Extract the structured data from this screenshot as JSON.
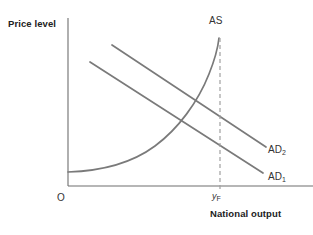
{
  "figure": {
    "type": "economics-diagram",
    "title_visible": false,
    "background_color": "#ffffff",
    "line_color": "#7a7a7a",
    "axis_color": "#6e6e6e",
    "dashed_color": "#a0a0a0"
  },
  "axes": {
    "y_axis_label": "Price level",
    "x_axis_label": "National output",
    "origin_label": "O",
    "x_marker_label": "y",
    "x_marker_subscript": "F"
  },
  "curves": [
    {
      "id": "as",
      "label": "AS",
      "label_subscript": "",
      "description": "Aggregate supply curve, flat at low output and near-vertical at full-employment output"
    },
    {
      "id": "ad2",
      "label": "AD",
      "label_subscript": "2",
      "description": "Higher aggregate demand curve, downward sloping"
    },
    {
      "id": "ad1",
      "label": "AD",
      "label_subscript": "1",
      "description": "Lower aggregate demand curve, downward sloping"
    }
  ],
  "chart_data": {
    "type": "line",
    "title": "",
    "xlabel": "National output",
    "ylabel": "Price level",
    "grid": false,
    "legend": "inline-labels",
    "xlim": [
      0,
      1
    ],
    "ylim": [
      0,
      1
    ],
    "annotations": [
      {
        "text": "AS",
        "x": 0.62,
        "y": 0.95
      },
      {
        "text": "AD2",
        "x": 0.96,
        "y": 0.27
      },
      {
        "text": "AD1",
        "x": 0.96,
        "y": 0.08
      },
      {
        "text": "O",
        "x": 0.0,
        "y": 0.0
      },
      {
        "text": "yF",
        "x": 0.74,
        "y": 0.0
      }
    ],
    "vertical_reference_line": {
      "label": "yF",
      "x": 0.74,
      "style": "dashed"
    },
    "series": [
      {
        "name": "AS",
        "style": "solid",
        "points": [
          [
            0.0,
            0.095
          ],
          [
            0.12,
            0.11
          ],
          [
            0.24,
            0.15
          ],
          [
            0.36,
            0.215
          ],
          [
            0.46,
            0.3
          ],
          [
            0.55,
            0.42
          ],
          [
            0.62,
            0.56
          ],
          [
            0.68,
            0.7
          ],
          [
            0.72,
            0.83
          ],
          [
            0.74,
            0.96
          ]
        ]
      },
      {
        "name": "AD2",
        "style": "solid",
        "points": [
          [
            0.22,
            0.88
          ],
          [
            1.0,
            0.31
          ]
        ]
      },
      {
        "name": "AD1",
        "style": "solid",
        "points": [
          [
            0.11,
            0.76
          ],
          [
            0.98,
            0.13
          ]
        ]
      }
    ]
  },
  "svg_geometry": {
    "y_axis": {
      "x": 68,
      "y_top": 18,
      "y_bottom": 186
    },
    "x_axis": {
      "y": 186,
      "x_left": 68,
      "x_right": 313
    },
    "as_path": "M 68,172 C 100,171 132,163 155,146 C 178,129 198,102 209,74 C 215,59 218,47 219,38",
    "ad2_path": "M 112,45 L 266,147",
    "ad1_path": "M 90,62 L 263,173",
    "dashed_path": "M 220,38 L 220,190"
  }
}
